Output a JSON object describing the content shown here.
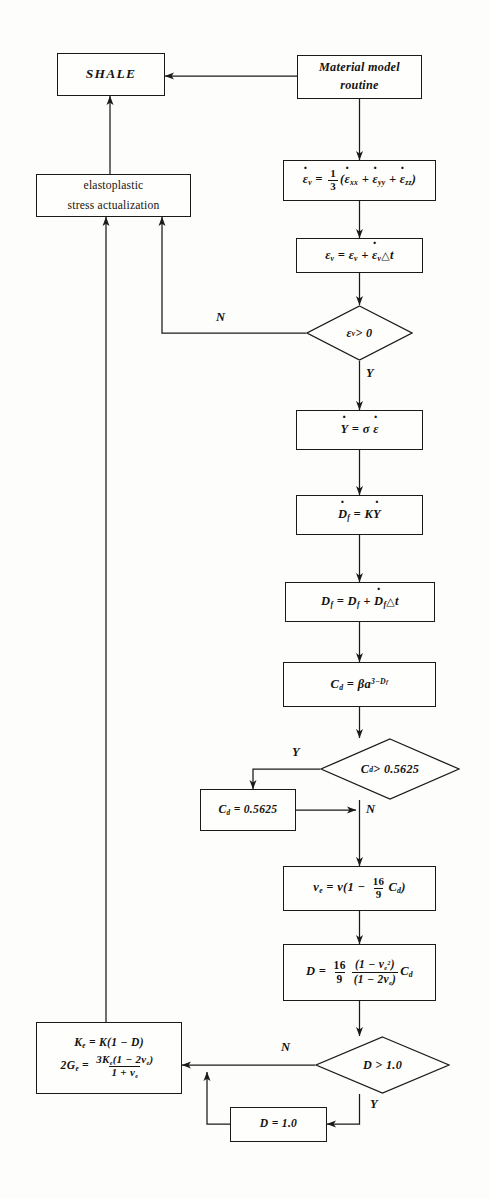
{
  "diagram": {
    "type": "flowchart",
    "stroke_color": "#1b1a17",
    "background_color": "#fdfdfc"
  },
  "nodes": {
    "shale": {
      "label": "SHALE",
      "shape": "process"
    },
    "material_model": {
      "line1": "Material model",
      "line2": "routine",
      "shape": "process"
    },
    "elastoplastic": {
      "line1": "elastoplastic",
      "line2": "stress   actualization",
      "shape": "process"
    },
    "vol_strain_rate": {
      "label": "ε̇ᵥ = 1/3(ε̇ₓₓ + ε̇ᵧᵧ + ε̇zz)",
      "shape": "process"
    },
    "vol_strain": {
      "label": "εᵥ = εᵥ + ε̇ᵥΔt",
      "shape": "process"
    },
    "check_strain": {
      "label": "εᵥ > 0",
      "shape": "decision",
      "yes": "Y",
      "no": "N"
    },
    "y_rate": {
      "label": "Ẏ = σ ε̇",
      "shape": "process"
    },
    "df_rate": {
      "label": "Ḋf = K Ẏ",
      "shape": "process"
    },
    "df_update": {
      "label": "Df = Df + Ḋf Δt",
      "shape": "process"
    },
    "cd_calc": {
      "label": "Cd = βa^(3−Df)",
      "shape": "process"
    },
    "check_cd": {
      "label": "Cd > 0.5625",
      "shape": "decision",
      "yes": "Y",
      "no": "N"
    },
    "cd_clamp": {
      "label": "Cd = 0.5625",
      "shape": "process",
      "value": "0.5625"
    },
    "poisson": {
      "label": "νₑ = ν(1 − 16/9 Cd)",
      "shape": "process"
    },
    "damage": {
      "label": "D = 16/9 (1 − νₑ²)/(1 − 2νₑ) Cd",
      "shape": "process"
    },
    "check_d": {
      "label": "D > 1.0",
      "shape": "decision",
      "yes": "Y",
      "no": "N"
    },
    "d_clamp": {
      "label": "D = 1.0",
      "shape": "process",
      "value": "1.0"
    },
    "moduli": {
      "line1": "Kₑ = K(1 − D)",
      "line2": "2Gₑ = 3Kₑ(1 − 2νₑ)/(1 + νₑ)",
      "shape": "process"
    }
  },
  "branch_labels": {
    "strain_no": "N",
    "strain_yes": "Y",
    "cd_yes": "Y",
    "cd_no": "N",
    "d_no": "N",
    "d_yes": "Y"
  },
  "constants": {
    "cd_threshold": "0.5625",
    "d_threshold": "1.0",
    "poisson_factor_num": "16",
    "poisson_factor_den": "9",
    "strain_factor_num": "1",
    "strain_factor_den": "3",
    "fractal_exponent_base": "3"
  }
}
